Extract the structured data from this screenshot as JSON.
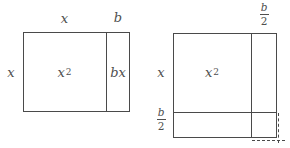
{
  "colors": {
    "background": "#ffffff",
    "line": "#4a4a4a",
    "text": "#4f4f4f"
  },
  "left_diagram": {
    "top_width_label": "x",
    "top_strip_label": "b",
    "left_height_label": "x",
    "area_main": {
      "base": "x",
      "exponent": "2"
    },
    "area_strip": "bx"
  },
  "right_diagram": {
    "top_strip_fraction": {
      "numerator": "b",
      "denominator": "2"
    },
    "left_height_label": "x",
    "area_main": {
      "base": "x",
      "exponent": "2"
    },
    "bottom_strip_fraction": {
      "numerator": "b",
      "denominator": "2"
    }
  }
}
